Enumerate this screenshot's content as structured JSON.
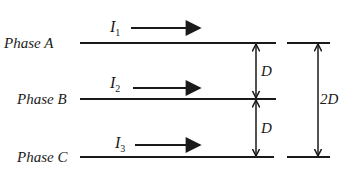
{
  "phases": [
    {
      "label": "Phase A",
      "current": "I",
      "sub": "1"
    },
    {
      "label": "Phase B",
      "current": "I",
      "sub": "2"
    },
    {
      "label": "Phase C",
      "current": "I",
      "sub": "3"
    }
  ],
  "spacing": {
    "ab": "D",
    "bc": "D",
    "ac": "2D"
  },
  "colors": {
    "line": "#1a1a1a",
    "background": "#ffffff"
  }
}
